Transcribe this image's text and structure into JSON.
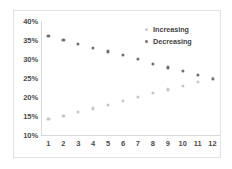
{
  "chart_data": {
    "type": "scatter",
    "title": "",
    "xlabel": "",
    "ylabel": "",
    "grid": false,
    "legend_position": "top-right",
    "categories": [
      1,
      2,
      3,
      4,
      5,
      6,
      7,
      8,
      9,
      10,
      11,
      12
    ],
    "x": [
      1,
      2,
      3,
      4,
      5,
      6,
      7,
      8,
      9,
      10,
      11,
      12
    ],
    "xlim": [
      0.5,
      12.5
    ],
    "ylim": [
      10,
      40
    ],
    "ytick_labels": [
      "10%",
      "15%",
      "20%",
      "25%",
      "30%",
      "35%",
      "40%"
    ],
    "ytick_values": [
      10,
      15,
      20,
      25,
      30,
      35,
      40
    ],
    "xtick_labels": [
      "1",
      "2",
      "3",
      "4",
      "5",
      "6",
      "7",
      "8",
      "9",
      "10",
      "11",
      "12"
    ],
    "series": [
      {
        "name": "Increasing",
        "color": "#c6c6c6",
        "values": [
          14.2,
          15.0,
          16.0,
          17.0,
          18.0,
          19.0,
          20.0,
          21.0,
          22.0,
          23.0,
          24.0,
          25.0
        ]
      },
      {
        "name": "Decreasing",
        "color": "#6f6f6f",
        "values": [
          36.0,
          35.0,
          34.0,
          33.0,
          32.0,
          31.0,
          30.0,
          28.8,
          27.8,
          26.8,
          25.8,
          24.8
        ]
      }
    ]
  },
  "legend": {
    "entries": [
      {
        "label": "Increasing",
        "color": "#c6c6c6"
      },
      {
        "label": "Decreasing",
        "color": "#6f6f6f"
      }
    ]
  }
}
